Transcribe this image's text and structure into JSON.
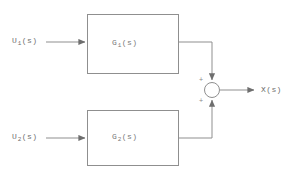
{
  "diagram": {
    "type": "control-system-block-diagram",
    "line_color": "#8a8a8a",
    "text_color": "#6f6f6f",
    "background": "#ffffff",
    "inputs": [
      {
        "id": "u1",
        "base": "U",
        "subscript": "1",
        "suffix": "(s)",
        "full_label": "U1(s)"
      },
      {
        "id": "u2",
        "base": "U",
        "subscript": "2",
        "suffix": "(s)",
        "full_label": "U2(s)"
      }
    ],
    "blocks": [
      {
        "id": "g1",
        "base": "G",
        "subscript": "1",
        "suffix": "(s)",
        "full_label": "G1(s)"
      },
      {
        "id": "g2",
        "base": "G",
        "subscript": "2",
        "suffix": "(s)",
        "full_label": "G2(s)"
      }
    ],
    "summing_junction": {
      "id": "sum",
      "shape": "circle",
      "signs": [
        {
          "id": "top",
          "symbol": "+"
        },
        {
          "id": "bottom",
          "symbol": "+"
        }
      ]
    },
    "output": {
      "id": "x",
      "base": "X",
      "suffix": "(s)",
      "full_label": "X(s)"
    }
  }
}
